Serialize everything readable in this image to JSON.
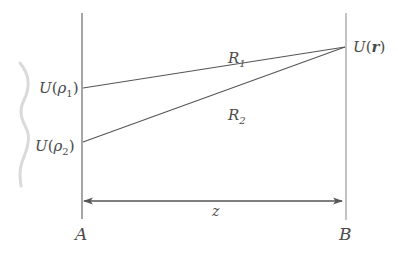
{
  "diagram": {
    "planes": {
      "left": {
        "label": "A"
      },
      "right": {
        "label": "B"
      }
    },
    "points": {
      "source1": {
        "func": "U",
        "arg": "ρ",
        "sub": "1"
      },
      "source2": {
        "func": "U",
        "arg": "ρ",
        "sub": "2"
      },
      "observation": {
        "func": "U",
        "arg": "r"
      }
    },
    "rays": [
      {
        "label": "R",
        "sub": "1"
      },
      {
        "label": "R",
        "sub": "2"
      }
    ],
    "distance": {
      "label": "z"
    },
    "paren_open": "(",
    "paren_close": ")",
    "colors": {
      "lines": "#555555",
      "text": "#4a4a4a",
      "wave": "#d8d8d8"
    }
  }
}
